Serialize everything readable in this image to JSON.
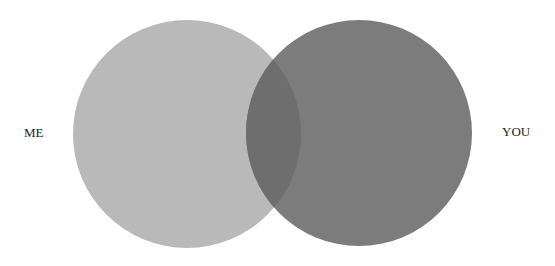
{
  "diagram": {
    "type": "venn",
    "sets": [
      {
        "id": "me",
        "label": "ME",
        "color": "#b9b9b9"
      },
      {
        "id": "you",
        "label": "YOU",
        "color": "#7c7c7c"
      }
    ],
    "overlap_color": "#6e6e6e",
    "background": "#ffffff"
  }
}
